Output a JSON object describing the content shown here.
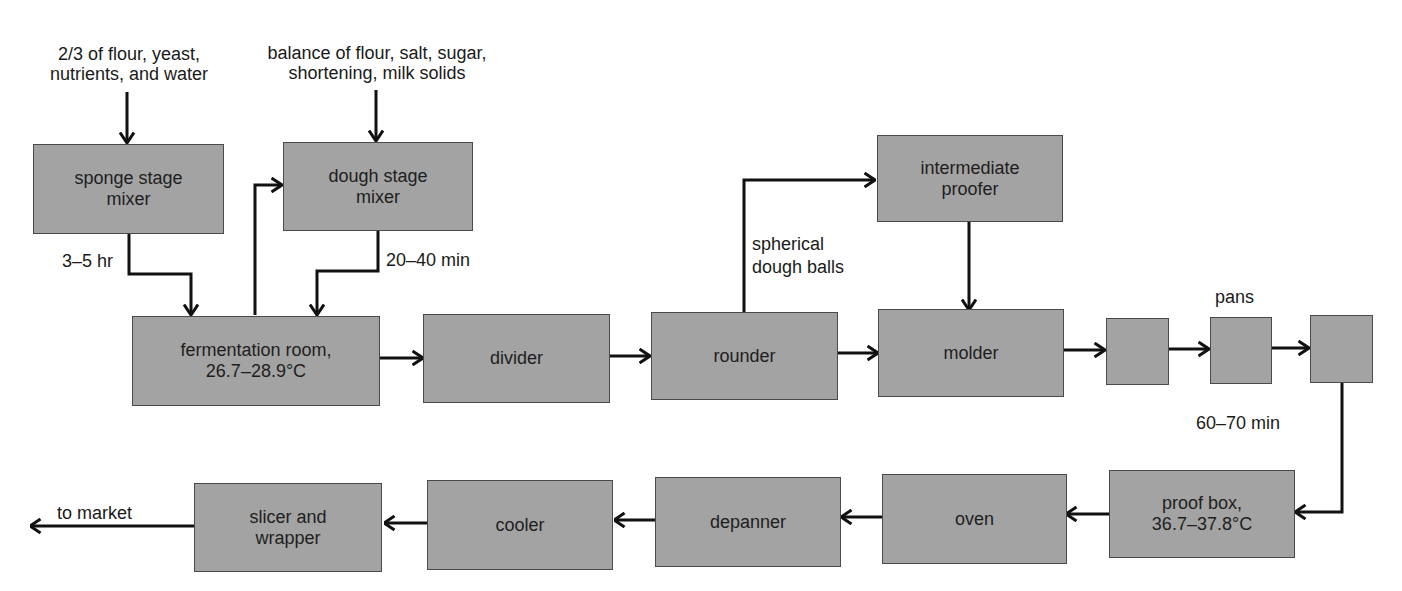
{
  "diagram": {
    "type": "process-flowchart",
    "boxes": {
      "sponge_mixer": "sponge stage\nmixer",
      "dough_mixer": "dough stage\nmixer",
      "fermentation": "fermentation room,\n26.7–28.9°C",
      "divider": "divider",
      "rounder": "rounder",
      "intermediate_proofer": "intermediate\nproofer",
      "molder": "molder",
      "unlabeled_1": "",
      "pans": "",
      "unlabeled_2": "",
      "proof_box": "proof box,\n36.7–37.8°C",
      "oven": "oven",
      "depanner": "depanner",
      "cooler": "cooler",
      "slicer_wrapper": "slicer and\nwrapper"
    },
    "labels": {
      "sponge_inputs": "2/3 of flour, yeast,\nnutrients, and water",
      "dough_inputs": "balance of flour, salt, sugar,\nshortening, milk solids",
      "sponge_time": "3–5 hr",
      "dough_time": "20–40 min",
      "dough_balls": "spherical\ndough balls",
      "pans": "pans",
      "proof_time": "60–70 min",
      "to_market": "to market"
    },
    "edges": [
      [
        "sponge_inputs",
        "sponge_mixer"
      ],
      [
        "dough_inputs",
        "dough_mixer"
      ],
      [
        "sponge_mixer",
        "fermentation",
        "3–5 hr"
      ],
      [
        "fermentation",
        "dough_mixer"
      ],
      [
        "dough_mixer",
        "fermentation",
        "20–40 min"
      ],
      [
        "fermentation",
        "divider"
      ],
      [
        "divider",
        "rounder"
      ],
      [
        "rounder",
        "intermediate_proofer",
        "spherical dough balls"
      ],
      [
        "rounder",
        "molder"
      ],
      [
        "intermediate_proofer",
        "molder"
      ],
      [
        "molder",
        "unlabeled_1"
      ],
      [
        "unlabeled_1",
        "pans"
      ],
      [
        "pans",
        "unlabeled_2"
      ],
      [
        "unlabeled_2",
        "proof_box",
        "60–70 min"
      ],
      [
        "proof_box",
        "oven"
      ],
      [
        "oven",
        "depanner"
      ],
      [
        "depanner",
        "cooler"
      ],
      [
        "cooler",
        "slicer_wrapper"
      ],
      [
        "slicer_wrapper",
        "to_market"
      ]
    ]
  },
  "colors": {
    "box_fill": "#a3a3a3",
    "box_border": "#4a4a4a",
    "line": "#111111",
    "text": "#1a1a1a"
  }
}
